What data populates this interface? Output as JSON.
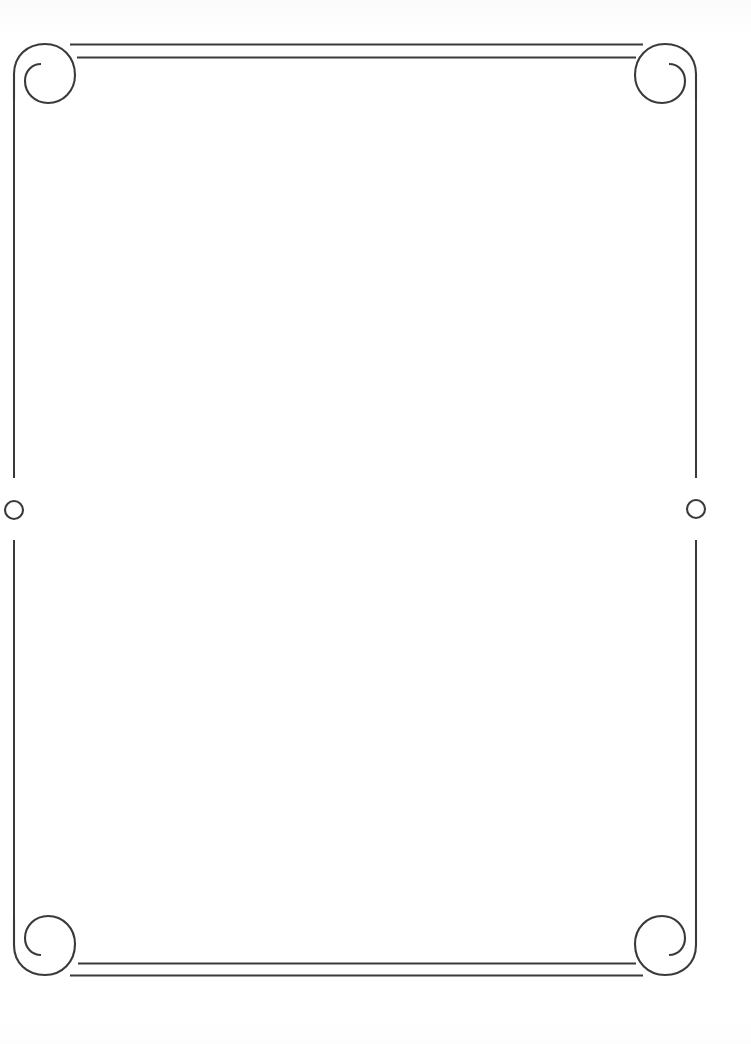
{
  "page": {
    "width": 751,
    "height": 1044,
    "background_color": "#ffffff",
    "body_text": ""
  },
  "frame": {
    "stroke_color": "#3a3a3c",
    "stroke_width": 2.1,
    "left": 14,
    "right": 696,
    "top": 44,
    "bottom": 975,
    "corner_size": 58,
    "style_name": "scrollwork-spiral-border"
  },
  "rules": {
    "top_outer": {
      "y": 44,
      "x_start": 70,
      "x_end": 643
    },
    "top_inner": {
      "y": 57,
      "x_start": 77,
      "x_end": 636
    },
    "bottom_inner": {
      "y": 963,
      "x_start": 78,
      "x_end": 636
    },
    "bottom_outer": {
      "y": 975,
      "x_start": 70,
      "x_end": 643
    }
  },
  "corners": {
    "top_left": {
      "label": "Top Left Spiral Flourish",
      "cx": 44,
      "cy": 74
    },
    "top_right": {
      "label": "Top Right Spiral Flourish",
      "cx": 666,
      "cy": 74
    },
    "bottom_left": {
      "label": "Bottom Left Spiral Flourish",
      "cx": 44,
      "cy": 945
    },
    "bottom_right": {
      "label": "Bottom Right Spiral Flourish",
      "cx": 666,
      "cy": 945
    }
  },
  "side_ornaments": {
    "left_circle": {
      "label": "Left Side Circle Medallion",
      "cx": 14,
      "cy": 510,
      "r": 9,
      "gap_top": 478,
      "gap_bottom": 540
    },
    "right_circle": {
      "label": "Right Side Circle Medallion",
      "cx": 696,
      "cy": 509,
      "r": 9,
      "gap_top": 478,
      "gap_bottom": 540
    }
  }
}
